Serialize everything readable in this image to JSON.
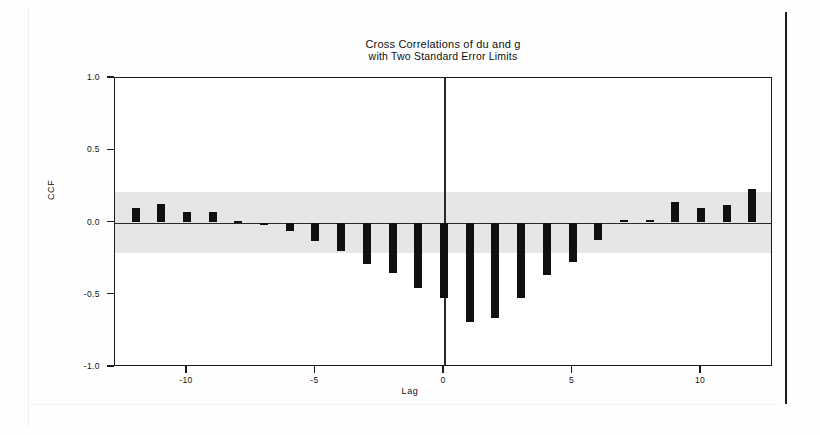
{
  "chart_data": {
    "type": "bar",
    "title": "Cross Correlations of du and g",
    "subtitle": "with Two Standard Error Limits",
    "xlabel": "Lag",
    "ylabel": "CCF",
    "xlim": [
      -12.8,
      12.8
    ],
    "ylim": [
      -1.0,
      1.0
    ],
    "grid": false,
    "legend": "none",
    "xticks": [
      -10,
      -5,
      0,
      5,
      10
    ],
    "xticklabels": [
      "-10",
      "-5",
      "0",
      "5",
      "10"
    ],
    "yticks": [
      1.0,
      0.5,
      0.0,
      -0.5,
      -1.0
    ],
    "yticklabels": [
      "1.0",
      "0.5",
      "0.0",
      "-0.5",
      "-1.0"
    ],
    "confidence_band": {
      "label": "two standard error limits",
      "upper": 0.21,
      "lower": -0.21,
      "color": "#e6e6e6"
    },
    "bar_color": "#101010",
    "categories": [
      -12,
      -11,
      -10,
      -9,
      -8,
      -7,
      -6,
      -5,
      -4,
      -3,
      -2,
      -1,
      0,
      1,
      2,
      3,
      4,
      5,
      6,
      7,
      8,
      9,
      10,
      11,
      12
    ],
    "values": [
      0.1,
      0.13,
      0.07,
      0.07,
      0.01,
      -0.02,
      -0.06,
      -0.13,
      -0.2,
      -0.29,
      -0.35,
      -0.45,
      -0.52,
      -0.69,
      -0.66,
      -0.52,
      -0.36,
      -0.27,
      -0.12,
      0.02,
      0.02,
      0.14,
      0.1,
      0.12,
      0.23
    ],
    "series": [
      {
        "name": "CCF",
        "values": [
          0.1,
          0.13,
          0.07,
          0.07,
          0.01,
          -0.02,
          -0.06,
          -0.13,
          -0.2,
          -0.29,
          -0.35,
          -0.45,
          -0.52,
          -0.69,
          -0.66,
          -0.52,
          -0.36,
          -0.27,
          -0.12,
          0.02,
          0.02,
          0.14,
          0.1,
          0.12,
          0.23
        ]
      }
    ]
  }
}
